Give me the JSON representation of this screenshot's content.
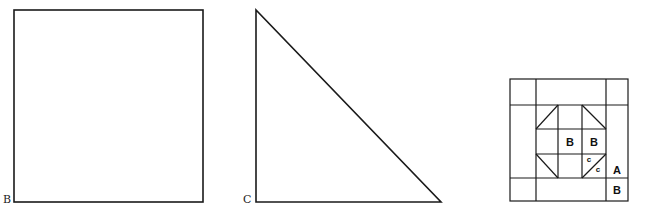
{
  "figure": {
    "square": {
      "label": "B",
      "x": 14,
      "y": 10,
      "size": 192
    },
    "triangle": {
      "label": "C",
      "points": [
        [
          256,
          10
        ],
        [
          256,
          202
        ],
        [
          441,
          202
        ]
      ]
    },
    "quilt_block": {
      "outer": {
        "x": 510,
        "y": 79,
        "w": 118,
        "h": 122
      },
      "border_lines": {
        "verticals": [
          536,
          606
        ],
        "horizontals": [
          105,
          178
        ]
      },
      "inner_lines": {
        "verticals": [
          558,
          582
        ],
        "horizontals": [
          129,
          154
        ]
      },
      "diagonals": [
        [
          [
            558,
            105
          ],
          [
            536,
            129
          ]
        ],
        [
          [
            582,
            105
          ],
          [
            606,
            129
          ]
        ],
        [
          [
            536,
            154
          ],
          [
            558,
            178
          ]
        ],
        [
          [
            606,
            154
          ],
          [
            582,
            178
          ]
        ]
      ],
      "labels": {
        "center_b": "B",
        "middle_right_b": "B",
        "corner_c_upper": "c",
        "corner_c_lower": "c",
        "border_a": "A",
        "corner_b": "B"
      }
    },
    "stroke_color": "#1a1a1a"
  }
}
